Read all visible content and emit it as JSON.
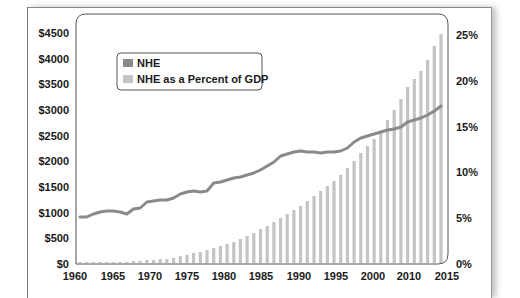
{
  "chart_data": {
    "type": "bar+line",
    "title": "",
    "xlabel": "",
    "ylabel_left": "",
    "ylabel_right": "",
    "x_tick_labels": [
      "1960",
      "1965",
      "1970",
      "1975",
      "1980",
      "1985",
      "1990",
      "1995",
      "2000",
      "2010",
      "2015"
    ],
    "y_left_ticks": [
      "$0",
      "$500",
      "$1000",
      "$1500",
      "$2000",
      "$2500",
      "$3000",
      "$3500",
      "$4000",
      "$4500"
    ],
    "y_right_ticks": [
      "0%",
      "5%",
      "10%",
      "15%",
      "20%",
      "25%"
    ],
    "ylim_left": [
      0,
      4500
    ],
    "ylim_right": [
      0,
      25
    ],
    "legend": [
      {
        "label": "NHE",
        "swatch": "#8a8a8a"
      },
      {
        "label": "NHE as a Percent of GDP",
        "swatch": "#c4c4c4"
      }
    ],
    "legend_position": "upper-left",
    "years": [
      1960,
      1961,
      1962,
      1963,
      1964,
      1965,
      1966,
      1967,
      1968,
      1969,
      1970,
      1971,
      1972,
      1973,
      1974,
      1975,
      1976,
      1977,
      1978,
      1979,
      1980,
      1981,
      1982,
      1983,
      1984,
      1985,
      1986,
      1987,
      1988,
      1989,
      1990,
      1991,
      1992,
      1993,
      1994,
      1995,
      1996,
      1997,
      1998,
      1999,
      2000,
      2001,
      2002,
      2003,
      2004,
      2005,
      2006,
      2007,
      2008,
      2009,
      2010,
      2011,
      2012,
      2013,
      2014
    ],
    "series": [
      {
        "name": "NHE (bars, $ billions, left axis)",
        "color": "#c4c4c4",
        "values": [
          27,
          29,
          32,
          35,
          38,
          42,
          46,
          52,
          59,
          66,
          75,
          83,
          94,
          103,
          117,
          133,
          153,
          174,
          196,
          224,
          256,
          295,
          331,
          365,
          403,
          440,
          475,
          515,
          576,
          640,
          721,
          788,
          855,
          916,
          967,
          1022,
          1069,
          1125,
          1191,
          1265,
          1369,
          1486,
          1628,
          1767,
          1895,
          2023,
          2157,
          2296,
          2403,
          2496,
          2595,
          2696,
          2795,
          2880,
          3031
        ]
      },
      {
        "name": "NHE as a Percent of GDP (line, right axis)",
        "color": "#8a8a8a",
        "values": [
          5.0,
          5.1,
          5.3,
          5.5,
          5.6,
          5.6,
          5.5,
          5.3,
          6.2,
          6.4,
          6.9,
          7.0,
          7.1,
          7.1,
          7.4,
          7.8,
          8.0,
          8.1,
          8.0,
          8.1,
          8.9,
          9.2,
          10.0,
          10.1,
          10.1,
          10.3,
          10.6,
          10.9,
          11.1,
          11.5,
          12.1,
          12.9,
          13.2,
          13.4,
          13.5,
          13.6,
          13.3,
          13.2,
          13.3,
          13.5,
          13.8,
          14.3,
          15.0,
          15.3,
          15.4,
          15.5,
          15.6,
          15.7,
          16.1,
          17.0,
          17.3,
          17.4,
          17.7,
          18.2,
          18.8
        ]
      }
    ]
  },
  "bars_px_top": [
    262,
    262,
    262,
    262,
    262,
    262,
    262,
    262,
    261,
    261,
    260,
    260,
    259,
    259,
    258,
    256,
    255,
    253,
    252,
    250,
    248,
    246,
    244,
    242,
    239,
    236,
    233,
    229,
    226,
    222,
    218,
    214,
    210,
    206,
    201,
    196,
    191,
    186,
    181,
    175,
    168,
    161,
    153,
    146,
    139,
    131,
    120,
    110,
    99,
    87,
    79,
    71,
    60,
    46,
    34
  ],
  "line_px_y": [
    217,
    217,
    214,
    212,
    211,
    211,
    212,
    214,
    209,
    208,
    202,
    201,
    200,
    200,
    198,
    194,
    192,
    191,
    192,
    191,
    183,
    182,
    180,
    178,
    177,
    175,
    173,
    170,
    166,
    162,
    156,
    154,
    152,
    151,
    152,
    152,
    153,
    152,
    152,
    151,
    148,
    142,
    138,
    136,
    134,
    132,
    130,
    129,
    127,
    122,
    120,
    118,
    115,
    111,
    106
  ]
}
